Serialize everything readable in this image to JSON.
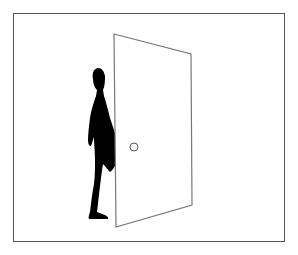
{
  "illustration": {
    "description": "Black silhouette of a person standing behind a partially open door, inside a rectangular frame",
    "colors": {
      "background": "#ffffff",
      "frame_stroke": "#555555",
      "door_stroke": "#777777",
      "door_fill": "#ffffff",
      "silhouette": "#000000",
      "knob_stroke": "#555555"
    },
    "frame": {
      "x": 13,
      "y": 13,
      "width": 271,
      "height": 228
    },
    "door": {
      "points": "114,34 191,54 192,205 116,227",
      "knob": {
        "cx": 134,
        "cy": 147,
        "r": 4
      }
    },
    "figure": {
      "facing": "right",
      "pose": "walking, partially hidden behind door"
    }
  }
}
